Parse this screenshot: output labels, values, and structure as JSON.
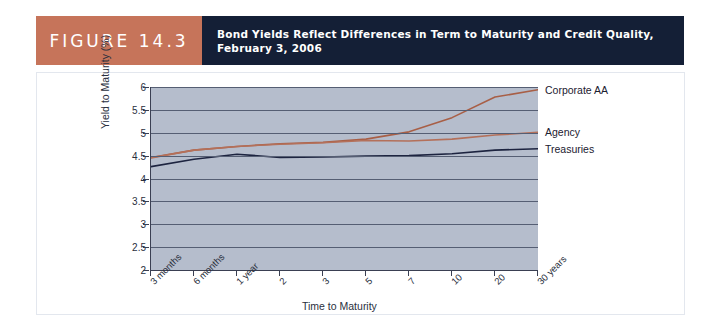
{
  "figure": {
    "tag": "FIGURE 14.3",
    "title_line1": "Bond Yields Reflect Differences in Term to Maturity and Credit Quality,",
    "title_line2": "February 3, 2006",
    "tag_bg": "#c6745a",
    "title_bg": "#141f36"
  },
  "chart_data": {
    "type": "line",
    "title": "Bond Yields Reflect Differences in Term to Maturity and Credit Quality, February 3, 2006",
    "xlabel": "Time to Maturity",
    "ylabel": "Yield to Maturity (%)",
    "categories": [
      "3 months",
      "6 months",
      "1 year",
      "2",
      "3",
      "5",
      "7",
      "10",
      "20",
      "30 years"
    ],
    "yticks": [
      "2",
      "2.5",
      "3",
      "3.5",
      "4",
      "4.5",
      "5",
      "5.5",
      "6"
    ],
    "ylim": [
      2,
      6
    ],
    "grid": true,
    "legend_position": "right-inline",
    "series": [
      {
        "name": "Corporate AA",
        "color": "#a85f46",
        "values": [
          4.46,
          4.62,
          4.7,
          4.76,
          4.79,
          4.86,
          5.02,
          5.33,
          5.78,
          5.94
        ]
      },
      {
        "name": "Agency",
        "color": "#b4705a",
        "values": [
          4.45,
          4.62,
          4.7,
          4.75,
          4.78,
          4.83,
          4.82,
          4.86,
          4.95,
          5.01
        ]
      },
      {
        "name": "Treasuries",
        "color": "#1d2440",
        "values": [
          4.26,
          4.42,
          4.53,
          4.46,
          4.47,
          4.49,
          4.5,
          4.54,
          4.62,
          4.65
        ]
      }
    ]
  }
}
